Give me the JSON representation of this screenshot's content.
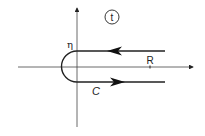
{
  "diagram": {
    "region_label": "t",
    "eta_label": "η",
    "radius_label": "R",
    "contour_label": "C",
    "stroke_color": "#222222"
  }
}
